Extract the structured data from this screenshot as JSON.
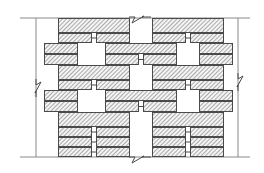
{
  "drawing": {
    "title": "Masonry bond pattern elevation",
    "description": "Hatched brick units in interlocking running bond between upper and lower boundary lines",
    "background_color": "#ffffff",
    "line_color": "#4a4a4a",
    "boundary_line_color": "#8a8a8a",
    "hatch_color": "#7a7a7a",
    "unit_fill_color": "#f2f2f2",
    "hatch_angle_degrees": 45,
    "hatch_spacing_px": 3,
    "canvas": {
      "width": 264,
      "height": 173
    }
  },
  "boundaries": {
    "top_line": {
      "name": "top-boundary-line",
      "y": 18,
      "x1": 20,
      "x2": 250
    },
    "bottom_line": {
      "name": "bottom-boundary-line",
      "y": 157,
      "x1": 20,
      "x2": 250
    },
    "left_extension": {
      "name": "left-extension-line",
      "x": 36,
      "y1": 18,
      "y2": 157
    },
    "right_extension": {
      "name": "right-extension-line",
      "x": 238,
      "y1": 18,
      "y2": 157
    }
  },
  "break_symbols": [
    {
      "name": "break-symbol-left",
      "orientation": "vertical",
      "x": 36,
      "y": 88
    },
    {
      "name": "break-symbol-right",
      "orientation": "vertical",
      "x": 238,
      "y": 82
    },
    {
      "name": "break-symbol-top",
      "orientation": "horizontal",
      "x": 140,
      "y": 17
    },
    {
      "name": "break-symbol-bottom",
      "orientation": "horizontal",
      "x": 140,
      "y": 157
    }
  ],
  "courses": [
    {
      "name": "course-1",
      "y": 18,
      "height": 15,
      "units": [
        {
          "x": 58,
          "width": 72
        },
        {
          "x": 152,
          "width": 72
        }
      ]
    },
    {
      "name": "course-2",
      "y": 33,
      "height": 10,
      "units": [
        {
          "x": 58,
          "width": 34
        },
        {
          "x": 96,
          "width": 34
        },
        {
          "x": 152,
          "width": 34
        },
        {
          "x": 190,
          "width": 34
        }
      ],
      "connectors": [
        {
          "x": 92,
          "width": 4
        },
        {
          "x": 186,
          "width": 4
        }
      ]
    },
    {
      "name": "course-3",
      "y": 43,
      "height": 11,
      "units": [
        {
          "x": 44,
          "width": 34
        },
        {
          "x": 105,
          "width": 72
        },
        {
          "x": 199,
          "width": 34
        }
      ]
    },
    {
      "name": "course-4",
      "y": 54,
      "height": 11,
      "units": [
        {
          "x": 44,
          "width": 34
        },
        {
          "x": 105,
          "width": 34
        },
        {
          "x": 143,
          "width": 34
        },
        {
          "x": 199,
          "width": 34
        }
      ],
      "connectors": [
        {
          "x": 139,
          "width": 4
        }
      ]
    },
    {
      "name": "course-5",
      "y": 65,
      "height": 15,
      "units": [
        {
          "x": 58,
          "width": 72
        },
        {
          "x": 152,
          "width": 72
        }
      ]
    },
    {
      "name": "course-6",
      "y": 80,
      "height": 10,
      "units": [
        {
          "x": 58,
          "width": 34
        },
        {
          "x": 96,
          "width": 34
        },
        {
          "x": 152,
          "width": 34
        },
        {
          "x": 190,
          "width": 34
        }
      ],
      "connectors": [
        {
          "x": 92,
          "width": 4
        },
        {
          "x": 186,
          "width": 4
        }
      ]
    },
    {
      "name": "course-7",
      "y": 90,
      "height": 11,
      "units": [
        {
          "x": 44,
          "width": 34
        },
        {
          "x": 105,
          "width": 72
        },
        {
          "x": 199,
          "width": 34
        }
      ]
    },
    {
      "name": "course-8",
      "y": 101,
      "height": 11,
      "units": [
        {
          "x": 44,
          "width": 34
        },
        {
          "x": 105,
          "width": 34
        },
        {
          "x": 143,
          "width": 34
        },
        {
          "x": 199,
          "width": 34
        }
      ],
      "connectors": [
        {
          "x": 139,
          "width": 4
        }
      ]
    },
    {
      "name": "course-9",
      "y": 112,
      "height": 15,
      "units": [
        {
          "x": 58,
          "width": 72
        },
        {
          "x": 152,
          "width": 72
        }
      ]
    },
    {
      "name": "course-10",
      "y": 127,
      "height": 10,
      "units": [
        {
          "x": 58,
          "width": 34
        },
        {
          "x": 96,
          "width": 34
        },
        {
          "x": 152,
          "width": 34
        },
        {
          "x": 190,
          "width": 34
        }
      ],
      "connectors": [
        {
          "x": 92,
          "width": 4
        },
        {
          "x": 186,
          "width": 4
        }
      ]
    },
    {
      "name": "course-11",
      "y": 137,
      "height": 10,
      "units": [
        {
          "x": 58,
          "width": 34
        },
        {
          "x": 96,
          "width": 34
        },
        {
          "x": 152,
          "width": 34
        },
        {
          "x": 190,
          "width": 34
        }
      ],
      "connectors": [
        {
          "x": 92,
          "width": 4
        },
        {
          "x": 186,
          "width": 4
        }
      ]
    },
    {
      "name": "course-12",
      "y": 147,
      "height": 10,
      "units": [
        {
          "x": 58,
          "width": 34
        },
        {
          "x": 96,
          "width": 34
        },
        {
          "x": 152,
          "width": 34
        },
        {
          "x": 190,
          "width": 34
        }
      ],
      "connectors": [
        {
          "x": 92,
          "width": 4
        },
        {
          "x": 186,
          "width": 4
        }
      ]
    }
  ]
}
